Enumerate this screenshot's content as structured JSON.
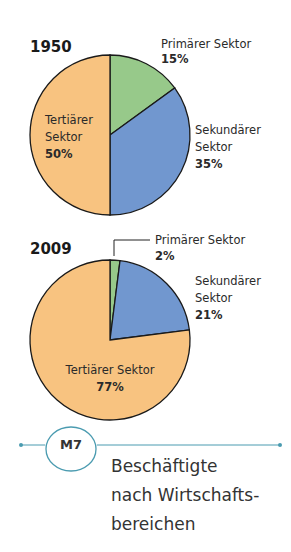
{
  "chart_data": [
    {
      "type": "pie",
      "title": "1950",
      "categories": [
        "Primärer Sektor",
        "Sekundärer Sektor",
        "Tertiärer Sektor"
      ],
      "values": [
        15,
        35,
        50
      ],
      "unit": "%",
      "colors": [
        "#97c98a",
        "#7197cf",
        "#f8c380"
      ],
      "labels": [
        {
          "lines": [
            "Primärer Sektor"
          ],
          "pct": "15%"
        },
        {
          "lines": [
            "Sekundärer",
            "Sektor"
          ],
          "pct": "35%"
        },
        {
          "lines": [
            "Tertiärer",
            "Sektor"
          ],
          "pct": "50%"
        }
      ]
    },
    {
      "type": "pie",
      "title": "2009",
      "categories": [
        "Primärer Sektor",
        "Sekundärer Sektor",
        "Tertiärer Sektor"
      ],
      "values": [
        2,
        21,
        77
      ],
      "unit": "%",
      "colors": [
        "#97c98a",
        "#7197cf",
        "#f8c380"
      ],
      "labels": [
        {
          "lines": [
            "Primärer Sektor"
          ],
          "pct": "2%"
        },
        {
          "lines": [
            "Sekundärer",
            "Sektor"
          ],
          "pct": "21%"
        },
        {
          "lines": [
            "Tertiärer Sektor"
          ],
          "pct": "77%"
        }
      ]
    }
  ],
  "caption": {
    "badge": "M7",
    "lines": [
      "Beschäftigte",
      "nach Wirtschafts-",
      "bereichen"
    ],
    "accent_color": "#4a9bb0"
  }
}
